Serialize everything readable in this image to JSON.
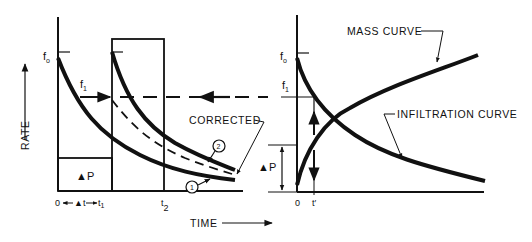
{
  "diagram": {
    "left_panel": {
      "y_axis_label": "RATE",
      "x_axis_label": "TIME",
      "f0_label": "f",
      "f0_sub": "o",
      "f1_label": "f",
      "f1_sub": "1",
      "delta_p_label": "▲P",
      "tick_origin": "0",
      "tick_delta_t": "▲t",
      "tick_t1": "t",
      "tick_t1_sub": "1",
      "tick_t2": "t",
      "tick_t2_sub": "2",
      "corrected_label": "CORRECTED",
      "curve1_marker": "1",
      "curve2_marker": "2"
    },
    "right_panel": {
      "f0_label": "f",
      "f0_sub": "o",
      "f1_label": "f",
      "f1_sub": "1",
      "delta_p_label": "▲P",
      "tick_origin": "0",
      "tick_t_prime": "t′",
      "mass_curve_label": "MASS CURVE",
      "infiltration_curve_label": "INFILTRATION CURVE"
    },
    "colors": {
      "ink": "#111111",
      "background": "#ffffff"
    }
  }
}
